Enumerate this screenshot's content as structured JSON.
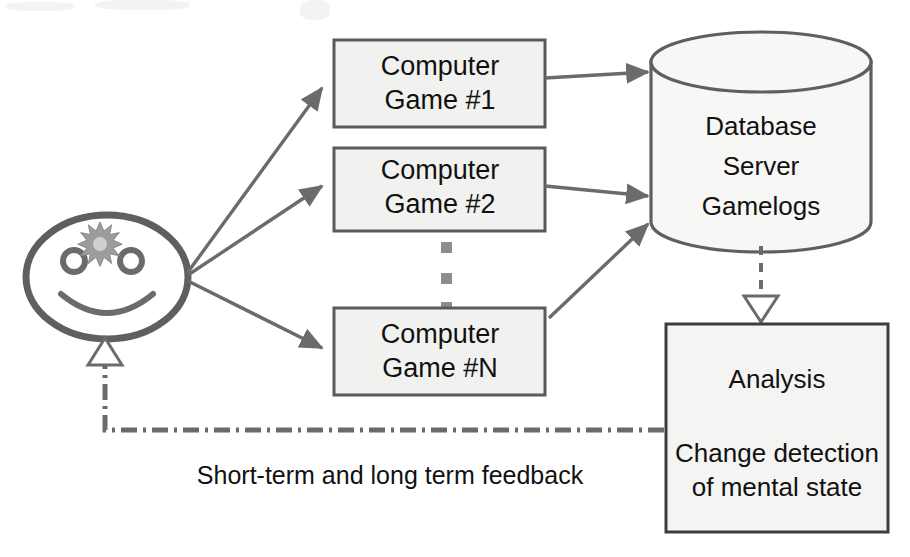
{
  "diagram": {
    "type": "flow-diagram",
    "canvas": {
      "width": 910,
      "height": 557
    },
    "colors": {
      "stroke": "#5f5f5f",
      "stroke_dark": "#4a4a4a",
      "box_fill": "#f1f1ef",
      "page_background": "#ffffff",
      "text": "#111111",
      "arrow_fill": "#6b6b6b",
      "hollow_arrow_fill": "#ffffff",
      "star_fill": "#9c9c9c"
    },
    "person": {
      "name": "smiley-face-user",
      "description": "smiling face with starburst on forehead",
      "features": [
        "head-ellipse",
        "left-eye",
        "right-eye",
        "smile",
        "starburst"
      ]
    },
    "games": [
      {
        "id": "game-1",
        "line1": "Computer",
        "line2": "Game #1"
      },
      {
        "id": "game-2",
        "line1": "Computer",
        "line2": "Game #2"
      },
      {
        "id": "game-n",
        "line1": "Computer",
        "line2": "Game #N"
      }
    ],
    "ellipsis": {
      "name": "vertical-ellipsis",
      "dots": 3
    },
    "database": {
      "id": "database-server",
      "shape": "cylinder",
      "lines": [
        "Database",
        "Server",
        "Gamelogs"
      ]
    },
    "analysis": {
      "id": "analysis-box",
      "title": "Analysis",
      "body_line1": "Change detection",
      "body_line2": "of mental state"
    },
    "feedback": {
      "id": "feedback-link",
      "label": "Short-term and long term feedback",
      "line_style": "dash-dot",
      "arrow_style": "hollow-triangle"
    },
    "db_to_analysis": {
      "id": "db-to-analysis-link",
      "line_style": "dashed",
      "arrow_style": "hollow-triangle"
    }
  }
}
